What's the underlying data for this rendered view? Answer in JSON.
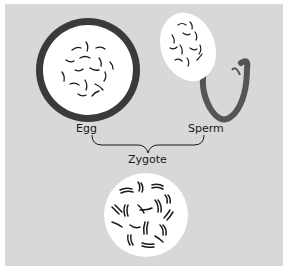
{
  "diagram": {
    "labels": {
      "egg": "Egg",
      "sperm": "Sperm",
      "zygote": "Zygote"
    },
    "colors": {
      "background": "#d8d8d8",
      "cell_fill": "#ffffff",
      "egg_membrane": "#3a3a3a",
      "sperm_tail": "#555555",
      "chromosome": "#1a1a1a"
    }
  }
}
